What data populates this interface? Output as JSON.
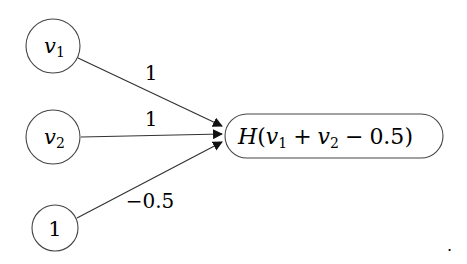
{
  "diagram": {
    "type": "perceptron",
    "nodes": {
      "v1": {
        "label": "v",
        "sub": "1"
      },
      "v2": {
        "label": "v",
        "sub": "2"
      },
      "bias": {
        "label": "1"
      },
      "output": {
        "fn": "H",
        "open": "(",
        "var1": "v",
        "sub1": "1",
        "plus": "+",
        "var2": "v",
        "sub2": "2",
        "minus": "−",
        "const": "0.5",
        "close": ")"
      }
    },
    "edges": [
      {
        "from": "v1",
        "to": "output",
        "weight": "1"
      },
      {
        "from": "v2",
        "to": "output",
        "weight": "1"
      },
      {
        "from": "bias",
        "to": "output",
        "weight": "−0.5"
      }
    ],
    "trailing_mark": "."
  }
}
